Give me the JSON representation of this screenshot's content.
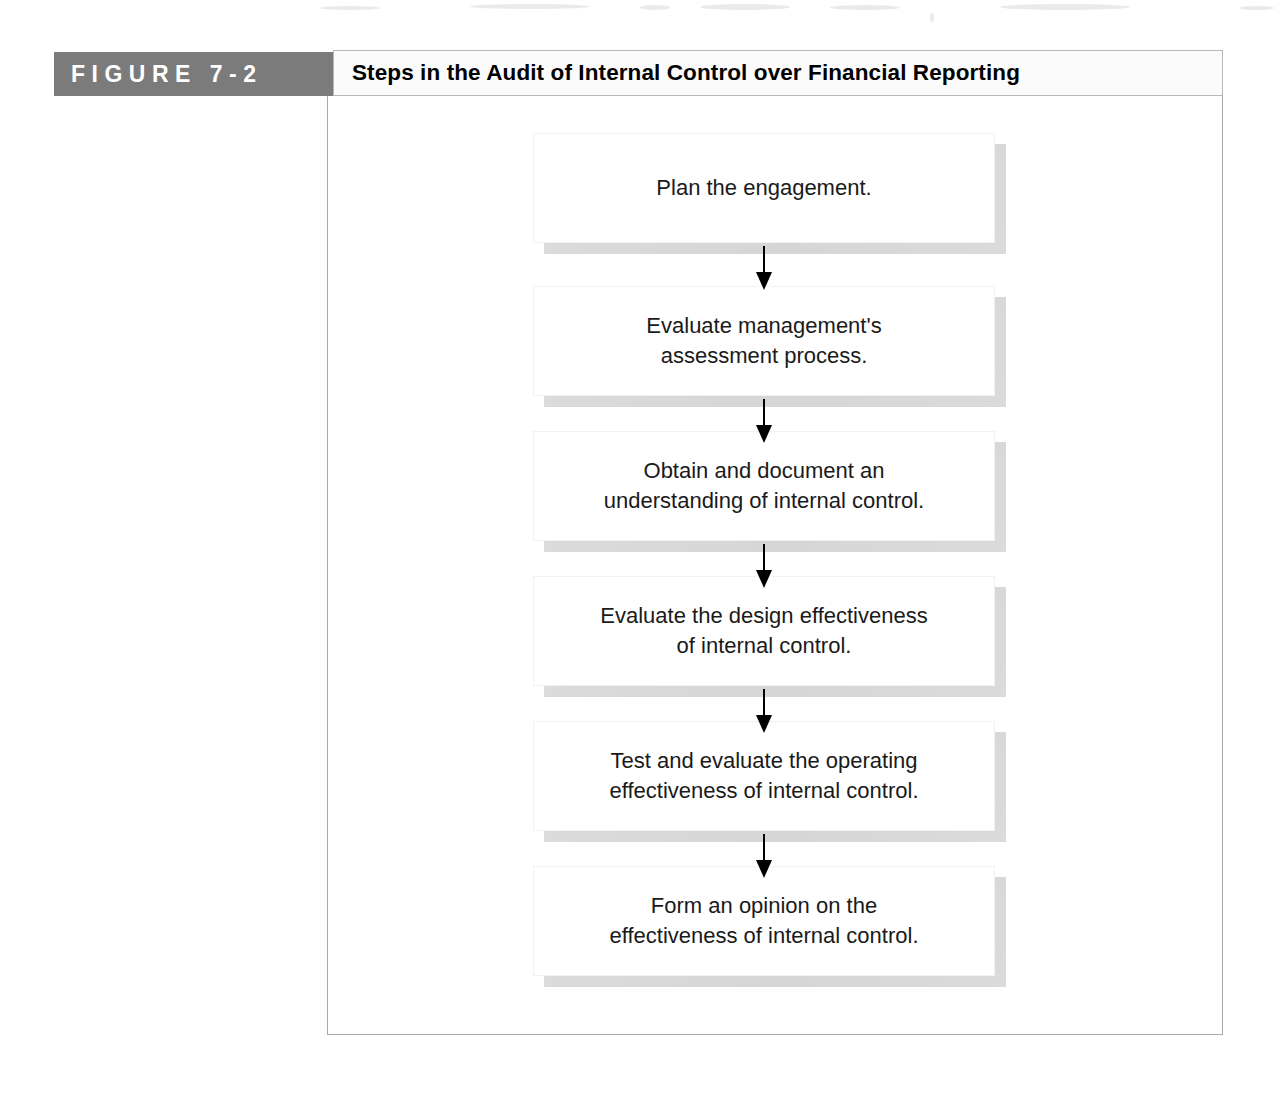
{
  "figure": {
    "label": "F I G U R E   7 - 2",
    "label_plain": "FIGURE 7-2",
    "title": "Steps in the Audit of Internal Control over Financial Reporting",
    "banner_color": "#7b7b7b",
    "banner_text_color": "#ffffff",
    "frame_border_color": "#a9a9a9"
  },
  "flowchart": {
    "type": "vertical-flow",
    "arrow_direction": "down",
    "steps": [
      {
        "index": 1,
        "text": "Plan the engagement."
      },
      {
        "index": 2,
        "text": "Evaluate management's\nassessment process."
      },
      {
        "index": 3,
        "text": "Obtain and document an\nunderstanding of internal control."
      },
      {
        "index": 4,
        "text": "Evaluate the design effectiveness\nof internal control."
      },
      {
        "index": 5,
        "text": "Test and evaluate the operating\neffectiveness of internal control."
      },
      {
        "index": 6,
        "text": "Form an opinion on the\neffectiveness of internal control."
      }
    ]
  }
}
